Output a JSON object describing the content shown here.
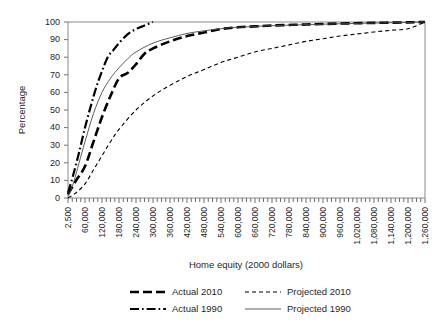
{
  "chart_data": {
    "type": "line",
    "title": "",
    "xlabel": "Home equity (2000 dollars)",
    "ylabel": "Percentage",
    "xlim": [
      2500,
      1260000
    ],
    "ylim": [
      0,
      100
    ],
    "grid": false,
    "legend_position": "bottom",
    "x_tick_labels": [
      "2,500",
      "60,000",
      "120,000",
      "180,000",
      "240,000",
      "300,000",
      "360,000",
      "420,000",
      "480,000",
      "540,000",
      "600,000",
      "660,000",
      "720,000",
      "780,000",
      "840,000",
      "900,000",
      "960,000",
      "1,020,000",
      "1,080,000",
      "1,140,000",
      "1,200,000",
      "1,260,000"
    ],
    "x_tick_values": [
      2500,
      60000,
      120000,
      180000,
      240000,
      300000,
      360000,
      420000,
      480000,
      540000,
      600000,
      660000,
      720000,
      780000,
      840000,
      900000,
      960000,
      1020000,
      1080000,
      1140000,
      1200000,
      1260000
    ],
    "y_tick_labels": [
      "0",
      "10",
      "20",
      "30",
      "40",
      "50",
      "60",
      "70",
      "80",
      "90",
      "100"
    ],
    "y_tick_values": [
      0,
      10,
      20,
      30,
      40,
      50,
      60,
      70,
      80,
      90,
      100
    ],
    "minor_ticks_per_interval": 3,
    "series": [
      {
        "name": "Actual 2010",
        "style": "thick-dashed",
        "x": [
          2500,
          30000,
          60000,
          90000,
          120000,
          150000,
          180000,
          210000,
          240000,
          270000,
          300000,
          360000,
          420000,
          480000,
          540000,
          600000,
          660000,
          720000,
          840000,
          960000,
          1080000,
          1200000,
          1260000
        ],
        "values": [
          2,
          10,
          18,
          32,
          46,
          58,
          68,
          71,
          76,
          82,
          85,
          89,
          92,
          94,
          96,
          97,
          97.5,
          98,
          98.6,
          99.1,
          99.5,
          99.8,
          100
        ]
      },
      {
        "name": "Actual 1990",
        "style": "dash-dot",
        "x": [
          2500,
          20000,
          40000,
          60000,
          80000,
          100000,
          120000,
          140000,
          160000,
          180000,
          210000,
          240000,
          270000,
          300000
        ],
        "values": [
          3,
          13,
          26,
          40,
          52,
          63,
          72,
          80,
          84,
          88,
          93,
          96,
          98,
          100
        ]
      },
      {
        "name": "Projected 2010",
        "style": "thin-dashed",
        "x": [
          2500,
          30000,
          60000,
          90000,
          120000,
          150000,
          180000,
          240000,
          300000,
          360000,
          420000,
          480000,
          540000,
          600000,
          660000,
          720000,
          780000,
          840000,
          900000,
          960000,
          1020000,
          1080000,
          1140000,
          1200000,
          1260000
        ],
        "values": [
          0,
          3,
          8,
          16,
          24,
          32,
          39,
          50,
          58,
          64,
          69,
          73,
          77,
          80,
          83,
          85,
          87,
          89,
          90.5,
          92,
          93.2,
          94.3,
          95.3,
          96.2,
          100
        ]
      },
      {
        "name": "Projected 1990",
        "style": "thin-solid",
        "x": [
          2500,
          20000,
          40000,
          60000,
          90000,
          120000,
          150000,
          180000,
          210000,
          240000,
          300000,
          360000,
          420000,
          480000,
          540000,
          600000,
          720000,
          840000,
          960000,
          1080000,
          1200000,
          1260000
        ],
        "values": [
          1,
          8,
          20,
          32,
          48,
          60,
          68,
          74,
          79,
          83,
          88,
          91,
          93.5,
          95,
          96.2,
          97,
          97.9,
          98.5,
          99,
          99.4,
          99.8,
          100
        ]
      }
    ]
  },
  "legend": {
    "items": [
      {
        "label": "Actual 2010",
        "style": "thick-dashed"
      },
      {
        "label": "Projected 2010",
        "style": "thin-dashed"
      },
      {
        "label": "Actual 1990",
        "style": "dash-dot"
      },
      {
        "label": "Projected 1990",
        "style": "thin-solid"
      }
    ]
  },
  "colors": {
    "line": "#000000",
    "axis": "#8a8a8a",
    "text": "#1f1f1f",
    "background": "#ffffff"
  }
}
